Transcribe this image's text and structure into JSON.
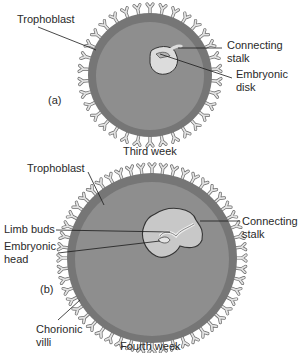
{
  "panel_a": {
    "tag": "(a)",
    "caption": "Third week",
    "labels": {
      "trophoblast": "Trophoblast",
      "connecting_stalk_1": "Connecting",
      "connecting_stalk_2": "stalk",
      "embryonic_disk_1": "Embryonic",
      "embryonic_disk_2": "disk"
    }
  },
  "panel_b": {
    "tag": "(b)",
    "caption": "Fourth week",
    "labels": {
      "trophoblast": "Trophoblast",
      "limb_buds": "Limb buds",
      "embryonic_head_1": "Embryonic",
      "embryonic_head_2": "head",
      "connecting_stalk_1": "Connecting",
      "connecting_stalk_2": "stalk",
      "chorionic_villi_1": "Chorionic",
      "chorionic_villi_2": "villi"
    }
  },
  "colors": {
    "outer_ring": "#7a7a7a",
    "inner_fill": "#8c8c8c",
    "villi": "#d8d8d8",
    "embryo": "#c4c4c4",
    "line": "#1a1a1a"
  }
}
